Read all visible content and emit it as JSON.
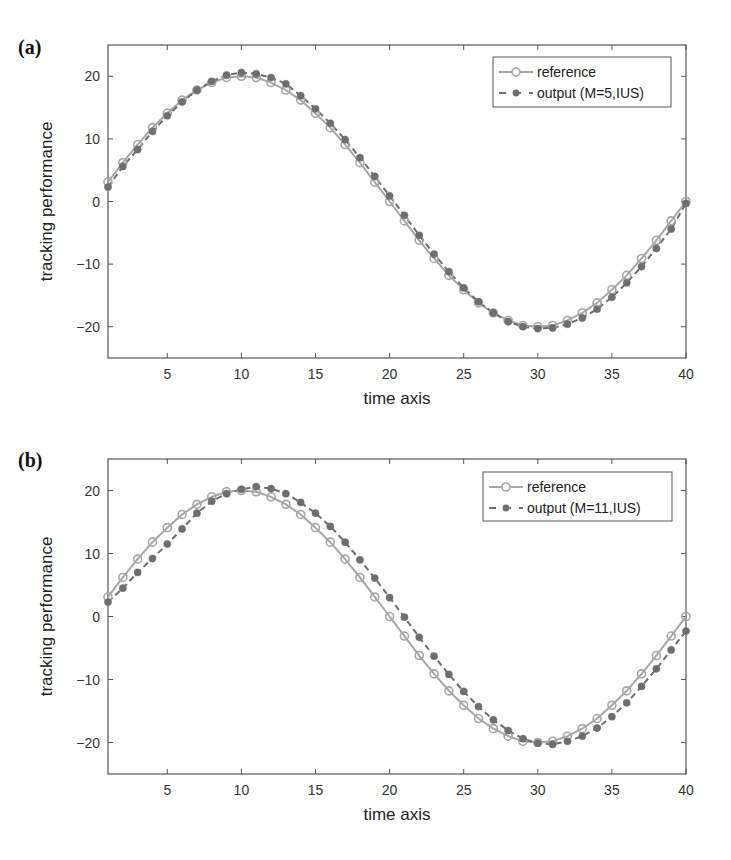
{
  "chart_data": [
    {
      "panel": "(a)",
      "type": "line",
      "title": "",
      "xlabel": "time axis",
      "ylabel": "tracking performance",
      "xlim": [
        1,
        40
      ],
      "ylim": [
        -25,
        25
      ],
      "xticks": [
        5,
        10,
        15,
        20,
        25,
        30,
        35,
        40
      ],
      "yticks": [
        -20,
        -10,
        0,
        10,
        20
      ],
      "grid": false,
      "legend_position": "upper right",
      "x": [
        1,
        2,
        3,
        4,
        5,
        6,
        7,
        8,
        9,
        10,
        11,
        12,
        13,
        14,
        15,
        16,
        17,
        18,
        19,
        20,
        21,
        22,
        23,
        24,
        25,
        26,
        27,
        28,
        29,
        30,
        31,
        32,
        33,
        34,
        35,
        36,
        37,
        38,
        39,
        40
      ],
      "series": [
        {
          "name": "reference",
          "style": "solid line, open circle markers",
          "color": "#a6a6a6",
          "values": [
            3.1,
            6.2,
            9.1,
            11.8,
            14.1,
            16.2,
            17.8,
            19.0,
            19.8,
            20.0,
            19.8,
            19.0,
            17.8,
            16.2,
            14.1,
            11.8,
            9.1,
            6.2,
            3.1,
            0.0,
            -3.1,
            -6.2,
            -9.1,
            -11.8,
            -14.1,
            -16.2,
            -17.8,
            -19.0,
            -19.8,
            -20.0,
            -19.8,
            -19.0,
            -17.8,
            -16.2,
            -14.1,
            -11.8,
            -9.1,
            -6.2,
            -3.1,
            0.0
          ]
        },
        {
          "name": "output (M=5,IUS)",
          "style": "dashed line, filled circle markers",
          "color": "#6e6e6e",
          "values": [
            2.3,
            5.6,
            8.3,
            11.2,
            13.7,
            15.9,
            17.8,
            19.2,
            20.2,
            20.6,
            20.4,
            19.8,
            18.8,
            16.9,
            14.8,
            12.5,
            9.9,
            7.0,
            4.0,
            0.9,
            -2.2,
            -5.4,
            -8.4,
            -11.2,
            -13.8,
            -16.0,
            -17.8,
            -19.2,
            -20.0,
            -20.3,
            -20.2,
            -19.6,
            -18.6,
            -17.2,
            -15.3,
            -13.0,
            -10.4,
            -7.5,
            -4.4,
            -0.3
          ]
        }
      ]
    },
    {
      "panel": "(b)",
      "type": "line",
      "title": "",
      "xlabel": "time axis",
      "ylabel": "tracking performance",
      "xlim": [
        1,
        40
      ],
      "ylim": [
        -25,
        25
      ],
      "xticks": [
        5,
        10,
        15,
        20,
        25,
        30,
        35,
        40
      ],
      "yticks": [
        -20,
        -10,
        0,
        10,
        20
      ],
      "grid": false,
      "legend_position": "upper right",
      "x": [
        1,
        2,
        3,
        4,
        5,
        6,
        7,
        8,
        9,
        10,
        11,
        12,
        13,
        14,
        15,
        16,
        17,
        18,
        19,
        20,
        21,
        22,
        23,
        24,
        25,
        26,
        27,
        28,
        29,
        30,
        31,
        32,
        33,
        34,
        35,
        36,
        37,
        38,
        39,
        40
      ],
      "series": [
        {
          "name": "reference",
          "style": "solid line, open circle markers",
          "color": "#a6a6a6",
          "values": [
            3.1,
            6.2,
            9.1,
            11.8,
            14.1,
            16.2,
            17.8,
            19.0,
            19.8,
            20.0,
            19.8,
            19.0,
            17.8,
            16.2,
            14.1,
            11.8,
            9.1,
            6.2,
            3.1,
            0.0,
            -3.1,
            -6.2,
            -9.1,
            -11.8,
            -14.1,
            -16.2,
            -17.8,
            -19.0,
            -19.8,
            -20.0,
            -19.8,
            -19.0,
            -17.8,
            -16.2,
            -14.1,
            -11.8,
            -9.1,
            -6.2,
            -3.1,
            0.0
          ]
        },
        {
          "name": "output (M=11,IUS)",
          "style": "dashed line, filled circle markers",
          "color": "#6e6e6e",
          "values": [
            2.3,
            4.5,
            7.0,
            9.2,
            11.5,
            13.9,
            16.4,
            18.3,
            19.5,
            20.2,
            20.6,
            20.3,
            19.5,
            18.1,
            16.4,
            14.3,
            11.8,
            9.0,
            6.1,
            3.0,
            -0.1,
            -3.3,
            -6.3,
            -9.2,
            -11.9,
            -14.3,
            -16.4,
            -18.1,
            -19.4,
            -20.1,
            -20.3,
            -19.8,
            -19.0,
            -17.7,
            -15.9,
            -13.7,
            -11.1,
            -8.3,
            -5.3,
            -2.3
          ]
        }
      ]
    }
  ],
  "panels": [
    {
      "label": "(a)",
      "ylabel": "tracking performance",
      "xlabel": "time axis",
      "legend": [
        "reference",
        "output (M=5,IUS)"
      ],
      "yticklabels": [
        "20",
        "10",
        "0",
        "−10",
        "−20"
      ],
      "xticklabels": [
        "5",
        "10",
        "15",
        "20",
        "25",
        "30",
        "35",
        "40"
      ]
    },
    {
      "label": "(b)",
      "ylabel": "tracking performance",
      "xlabel": "time axis",
      "legend": [
        "reference",
        "output (M=11,IUS)"
      ],
      "yticklabels": [
        "20",
        "10",
        "0",
        "−10",
        "−20"
      ],
      "xticklabels": [
        "5",
        "10",
        "15",
        "20",
        "25",
        "30",
        "35",
        "40"
      ]
    }
  ],
  "colors": {
    "axis": "#555555",
    "reference": "#a6a6a6",
    "output": "#6e6e6e"
  }
}
